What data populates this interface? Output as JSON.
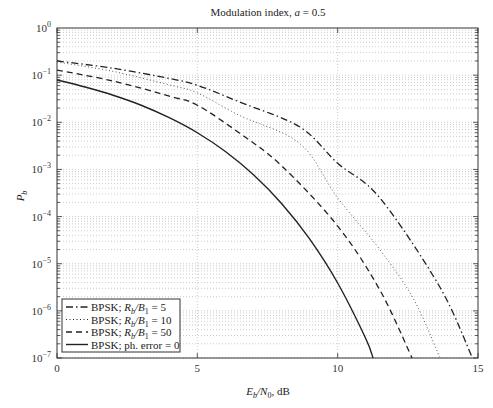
{
  "chart_data": {
    "type": "line",
    "title": "Modulation index, a = 0.5",
    "title_parts": {
      "prefix": "Modulation index, ",
      "var": "a",
      "suffix": " = 0.5"
    },
    "xlabel": "Eb/N0, dB",
    "xlabel_parts": {
      "E": "E",
      "b": "b",
      "slash": "/N",
      "zero": "0",
      "suffix": ", dB"
    },
    "ylabel": "Pb",
    "ylabel_parts": {
      "P": "P",
      "b": "b"
    },
    "xlim": [
      0,
      15
    ],
    "ylim": [
      1e-07,
      1
    ],
    "yscale": "log",
    "grid": true,
    "x_ticks": [
      "0",
      "5",
      "10",
      "15"
    ],
    "x_tick_values": [
      0,
      5,
      10,
      15
    ],
    "y_ticks": [
      {
        "base": "10",
        "exp": "0",
        "value": 1
      },
      {
        "base": "10",
        "exp": "−1",
        "value": 0.1
      },
      {
        "base": "10",
        "exp": "−2",
        "value": 0.01
      },
      {
        "base": "10",
        "exp": "−3",
        "value": 0.001
      },
      {
        "base": "10",
        "exp": "−4",
        "value": 0.0001
      },
      {
        "base": "10",
        "exp": "−5",
        "value": 1e-05
      },
      {
        "base": "10",
        "exp": "−6",
        "value": 1e-06
      },
      {
        "base": "10",
        "exp": "−7",
        "value": 1e-07
      }
    ],
    "legend_position": "bottom-left",
    "series": [
      {
        "name": "BPSK; Rb/B1 = 5",
        "legend": {
          "pre": "BPSK; ",
          "R": "R",
          "rsub": "b",
          "mid": "/B",
          "bsub": "1",
          "post": " = 5"
        },
        "style": "dashdot",
        "x": [
          0,
          2,
          4,
          5,
          6.5,
          8.66,
          10,
          11.5,
          13.64,
          14.8
        ],
        "y": [
          0.2,
          0.14,
          0.085,
          0.061,
          0.027,
          0.0079,
          0.00135,
          0.00025,
          3.2e-06,
          1e-07
        ]
      },
      {
        "name": "BPSK; Rb/B1 = 10",
        "legend": {
          "pre": "BPSK; ",
          "R": "R",
          "rsub": "b",
          "mid": "/B",
          "bsub": "1",
          "post": " = 10"
        },
        "style": "dotted",
        "x": [
          0,
          2,
          4,
          5,
          6.5,
          8.66,
          10,
          11.5,
          12.7,
          13.65
        ],
        "y": [
          0.19,
          0.12,
          0.062,
          0.042,
          0.014,
          0.0035,
          0.00025,
          2e-05,
          1.8e-06,
          1e-07
        ]
      },
      {
        "name": "BPSK; Rb/B1 = 50",
        "legend": {
          "pre": "BPSK; ",
          "R": "R",
          "rsub": "b",
          "mid": "/B",
          "bsub": "1",
          "post": " = 50"
        },
        "style": "dashed",
        "x": [
          0,
          2,
          4,
          5,
          6.5,
          8,
          10,
          11.5,
          12.65
        ],
        "y": [
          0.128,
          0.075,
          0.036,
          0.023,
          0.0059,
          0.0012,
          6.3e-05,
          2.8e-06,
          1e-07
        ]
      },
      {
        "name": "BPSK; ph. error = 0",
        "legend": {
          "pre": "BPSK; ph. error = 0",
          "R": "",
          "rsub": "",
          "mid": "",
          "bsub": "",
          "post": ""
        },
        "style": "solid",
        "x": [
          0,
          1,
          2,
          3,
          4,
          5,
          6,
          7,
          8,
          9,
          10,
          11,
          11.26
        ],
        "y": [
          0.079,
          0.056,
          0.0375,
          0.023,
          0.0125,
          0.006,
          0.0024,
          0.00077,
          0.00019,
          3.36e-05,
          3.9e-06,
          2.6e-07,
          1e-07
        ]
      }
    ]
  }
}
